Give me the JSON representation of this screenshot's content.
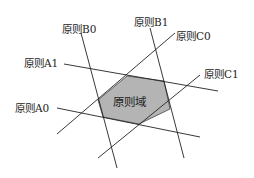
{
  "diagram": {
    "lines": [
      {
        "id": "A1",
        "label": "原则A1"
      },
      {
        "id": "A0",
        "label": "原则A0"
      },
      {
        "id": "B0",
        "label": "原则B0"
      },
      {
        "id": "B1",
        "label": "原则B1"
      },
      {
        "id": "C0",
        "label": "原则C0"
      },
      {
        "id": "C1",
        "label": "原则C1"
      }
    ],
    "region_label": "原则域",
    "colors": {
      "line": "#222222",
      "region_fill": "#b4b4b4"
    }
  }
}
